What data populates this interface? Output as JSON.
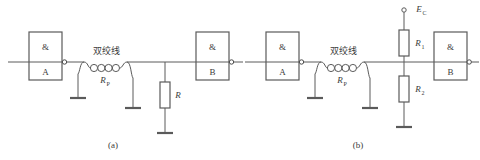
{
  "figure": {
    "type": "circuit-diagram-pair",
    "background_color": "#ffffff",
    "line_color": "#5a5a5a",
    "text_color": "#3a3a3a"
  },
  "panel_a": {
    "caption": "(a)",
    "gate_in": {
      "symbol": "&",
      "label": "A"
    },
    "gate_out": {
      "symbol": "&",
      "label": "B"
    },
    "twisted_pair": {
      "label": "双绞线",
      "resistor_label": "R",
      "resistor_sub": "P",
      "turns": 4
    },
    "terminator": {
      "label": "R"
    }
  },
  "panel_b": {
    "caption": "(b)",
    "gate_in": {
      "symbol": "&",
      "label": "A"
    },
    "gate_out": {
      "symbol": "&",
      "label": "B"
    },
    "twisted_pair": {
      "label": "双绞线",
      "resistor_label": "R",
      "resistor_sub": "P",
      "turns": 4
    },
    "supply": {
      "label": "E",
      "sub": "C"
    },
    "divider_top": {
      "label": "R",
      "sub": "1"
    },
    "divider_bottom": {
      "label": "R",
      "sub": "2"
    }
  }
}
